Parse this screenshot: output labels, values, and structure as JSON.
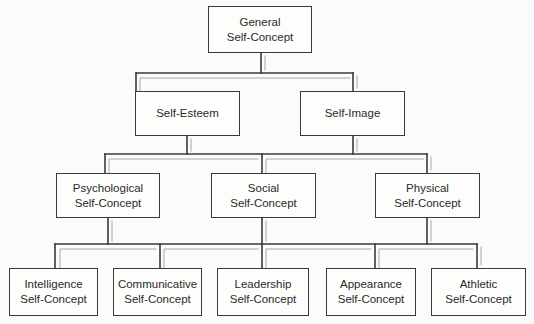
{
  "diagram": {
    "type": "hierarchy",
    "colors": {
      "background": "#fbfbf9",
      "line": "#3a3a3a",
      "inner_line": "#a8a8a8",
      "text": "#2a2a2a"
    },
    "nodes": {
      "general": {
        "line1": "General",
        "line2": "Self-Concept"
      },
      "self_esteem": {
        "line1": "Self-Esteem",
        "line2": ""
      },
      "self_image": {
        "line1": "Self-Image",
        "line2": ""
      },
      "psychological": {
        "line1": "Psychological",
        "line2": "Self-Concept"
      },
      "social": {
        "line1": "Social",
        "line2": "Self-Concept"
      },
      "physical": {
        "line1": "Physical",
        "line2": "Self-Concept"
      },
      "intelligence": {
        "line1": "Intelligence",
        "line2": "Self-Concept"
      },
      "communicative": {
        "line1": "Communicative",
        "line2": "Self-Concept"
      },
      "leadership": {
        "line1": "Leadership",
        "line2": "Self-Concept"
      },
      "appearance": {
        "line1": "Appearance",
        "line2": "Self-Concept"
      },
      "athletic": {
        "line1": "Athletic",
        "line2": "Self-Concept"
      }
    },
    "edges": [
      [
        "general",
        "self_esteem"
      ],
      [
        "general",
        "self_image"
      ],
      [
        "self_esteem",
        "psychological"
      ],
      [
        "self_esteem",
        "social"
      ],
      [
        "self_esteem",
        "physical"
      ],
      [
        "self_image",
        "psychological"
      ],
      [
        "self_image",
        "social"
      ],
      [
        "self_image",
        "physical"
      ],
      [
        "psychological",
        "intelligence"
      ],
      [
        "psychological",
        "communicative"
      ],
      [
        "social",
        "intelligence"
      ],
      [
        "social",
        "communicative"
      ],
      [
        "social",
        "leadership"
      ],
      [
        "social",
        "appearance"
      ],
      [
        "social",
        "athletic"
      ],
      [
        "physical",
        "appearance"
      ],
      [
        "physical",
        "athletic"
      ]
    ]
  }
}
